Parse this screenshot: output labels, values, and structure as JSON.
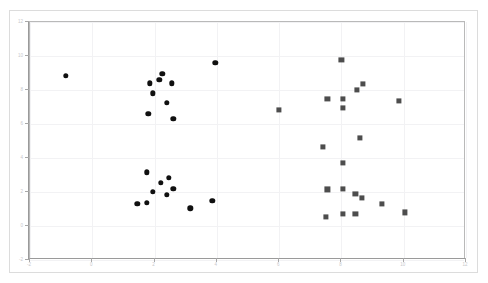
{
  "chart_title": "",
  "axes": {
    "xlim": [
      -2,
      12
    ],
    "ylim": [
      -2,
      12
    ],
    "xticks": [
      -2,
      0,
      2,
      4,
      6,
      8,
      10,
      12
    ],
    "yticks": [
      -2,
      0,
      2,
      4,
      6,
      8,
      10,
      12
    ],
    "xticklabels": [
      "-2",
      "0",
      "2",
      "4",
      "6",
      "8",
      "10",
      "12"
    ],
    "yticklabels": [
      "-2",
      "0",
      "2",
      "4",
      "6",
      "8",
      "10",
      "12"
    ],
    "xlabel": "",
    "ylabel": "",
    "grid": true
  },
  "colors": {
    "series_a": "#101010",
    "series_b": "#4d4d4d",
    "gridline": "#f2f2f4",
    "axis": "#9a9a9a",
    "ticklabel": "#c8c8cc",
    "outer_frame": "#dcdcdc",
    "background": "#ffffff"
  },
  "chart_data": {
    "type": "scatter",
    "title": "",
    "xlabel": "",
    "ylabel": "",
    "xlim": [
      -2,
      12
    ],
    "ylim": [
      -2,
      12
    ],
    "grid": true,
    "legend": null,
    "series": [
      {
        "name": "cluster-circles",
        "marker": "circle",
        "color": "#101010",
        "points": [
          [
            -0.85,
            8.85
          ],
          [
            1.85,
            8.4
          ],
          [
            2.15,
            8.6
          ],
          [
            2.25,
            8.95
          ],
          [
            2.55,
            8.4
          ],
          [
            1.95,
            7.8
          ],
          [
            2.4,
            7.25
          ],
          [
            1.8,
            6.6
          ],
          [
            2.6,
            6.3
          ],
          [
            3.95,
            9.6
          ],
          [
            1.75,
            3.15
          ],
          [
            2.2,
            2.55
          ],
          [
            2.45,
            2.85
          ],
          [
            1.95,
            2.0
          ],
          [
            2.4,
            1.85
          ],
          [
            2.6,
            2.2
          ],
          [
            1.45,
            1.3
          ],
          [
            1.75,
            1.35
          ],
          [
            3.15,
            1.05
          ],
          [
            3.85,
            1.5
          ]
        ]
      },
      {
        "name": "cluster-squares",
        "marker": "square",
        "color": "#4d4d4d",
        "points": [
          [
            8.0,
            9.75
          ],
          [
            7.55,
            7.5
          ],
          [
            8.05,
            7.5
          ],
          [
            8.5,
            8.0
          ],
          [
            8.7,
            8.35
          ],
          [
            8.05,
            6.95
          ],
          [
            9.85,
            7.35
          ],
          [
            6.0,
            6.85
          ],
          [
            8.6,
            5.2
          ],
          [
            7.4,
            4.65
          ],
          [
            8.05,
            3.7
          ],
          [
            7.55,
            2.15
          ],
          [
            8.05,
            2.2
          ],
          [
            8.45,
            1.9
          ],
          [
            8.65,
            1.65
          ],
          [
            9.3,
            1.3
          ],
          [
            7.5,
            0.55
          ],
          [
            8.05,
            0.7
          ],
          [
            8.45,
            0.7
          ],
          [
            10.05,
            0.8
          ]
        ]
      }
    ]
  }
}
